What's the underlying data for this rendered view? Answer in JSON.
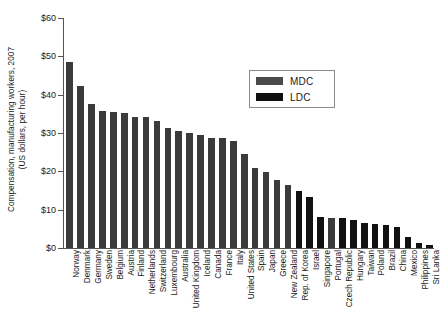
{
  "chart_data": {
    "type": "bar",
    "title": "",
    "subtitle": "",
    "xlabel": "",
    "ylabel": "Compensation, manufacturing workers, 2007 (US dollars, per hour)",
    "ylabel_line1": "Compensation, manufacturing workers, 2007",
    "ylabel_line2": "(US dollars, per hour)",
    "ylim": [
      0,
      60
    ],
    "ytick_labels": [
      "$0",
      "$10",
      "$20",
      "$30",
      "$40",
      "$50",
      "$60"
    ],
    "ytick_values": [
      0,
      10,
      20,
      30,
      40,
      50,
      60
    ],
    "grid": false,
    "legend_position": "upper-right-inside",
    "legend": [
      {
        "name": "MDC",
        "color": "#4a4a4a"
      },
      {
        "name": "LDC",
        "color": "#101010"
      }
    ],
    "categories": [
      "Norway",
      "Denmark",
      "Germany",
      "Sweden",
      "Belgium",
      "Austria",
      "Finland",
      "Netherlands",
      "Switzerland",
      "Luxembourg",
      "Australia",
      "United Kingdom",
      "Iceland",
      "Canada",
      "France",
      "Italy",
      "United States",
      "Spain",
      "Japan",
      "Greece",
      "New Zealand",
      "Rep. of Korea",
      "Israel",
      "Singapore",
      "Portugal",
      "Czech Republic",
      "Hungary",
      "Taiwan",
      "Poland",
      "Brazil",
      "China",
      "Mexico",
      "Philippines",
      "Sri Lanka"
    ],
    "values": [
      48.6,
      42.3,
      37.6,
      35.8,
      35.5,
      35.3,
      34.2,
      34.2,
      33.1,
      31.3,
      30.5,
      30.1,
      29.5,
      28.8,
      28.6,
      28.0,
      24.6,
      21.0,
      19.8,
      17.8,
      16.5,
      15.0,
      13.4,
      8.0,
      7.8,
      7.7,
      7.4,
      6.6,
      6.3,
      5.9,
      5.5,
      2.9,
      1.3,
      0.7
    ],
    "series_assignment": [
      "MDC",
      "MDC",
      "MDC",
      "MDC",
      "MDC",
      "MDC",
      "MDC",
      "MDC",
      "MDC",
      "MDC",
      "MDC",
      "MDC",
      "MDC",
      "MDC",
      "MDC",
      "MDC",
      "MDC",
      "MDC",
      "MDC",
      "MDC",
      "MDC",
      "LDC",
      "LDC",
      "LDC",
      "MDC",
      "LDC",
      "LDC",
      "LDC",
      "LDC",
      "LDC",
      "LDC",
      "LDC",
      "LDC",
      "LDC"
    ]
  }
}
